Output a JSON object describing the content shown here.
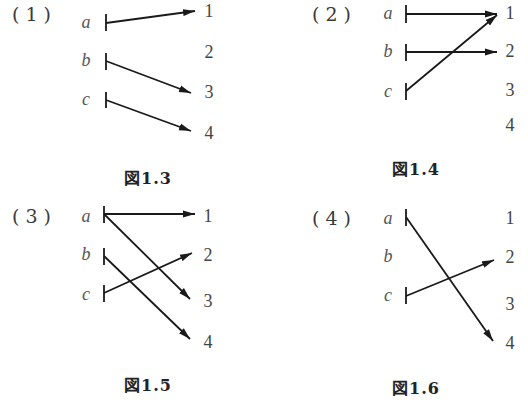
{
  "figures": [
    {
      "id": "panel-1",
      "number_label": "(1)",
      "caption": "図1.3",
      "sources": [
        "a",
        "b",
        "c"
      ],
      "targets": [
        "1",
        "2",
        "3",
        "4"
      ],
      "mappings": [
        {
          "from": "a",
          "to": "1"
        },
        {
          "from": "b",
          "to": "3"
        },
        {
          "from": "c",
          "to": "4"
        }
      ],
      "sources_with_tick": [
        "a",
        "b",
        "c"
      ]
    },
    {
      "id": "panel-2",
      "number_label": "(2)",
      "caption": "図1.4",
      "sources": [
        "a",
        "b",
        "c"
      ],
      "targets": [
        "1",
        "2",
        "3",
        "4"
      ],
      "mappings": [
        {
          "from": "a",
          "to": "1"
        },
        {
          "from": "b",
          "to": "2"
        },
        {
          "from": "c",
          "to": "1"
        }
      ],
      "sources_with_tick": [
        "a",
        "b",
        "c"
      ]
    },
    {
      "id": "panel-3",
      "number_label": "(3)",
      "caption": "図1.5",
      "sources": [
        "a",
        "b",
        "c"
      ],
      "targets": [
        "1",
        "2",
        "3",
        "4"
      ],
      "mappings": [
        {
          "from": "a",
          "to": "1"
        },
        {
          "from": "a",
          "to": "3"
        },
        {
          "from": "b",
          "to": "4"
        },
        {
          "from": "c",
          "to": "2"
        }
      ],
      "sources_with_tick": [
        "a",
        "b",
        "c"
      ]
    },
    {
      "id": "panel-4",
      "number_label": "(4)",
      "caption": "図1.6",
      "sources": [
        "a",
        "b",
        "c"
      ],
      "targets": [
        "1",
        "2",
        "3",
        "4"
      ],
      "mappings": [
        {
          "from": "a",
          "to": "4"
        },
        {
          "from": "c",
          "to": "2"
        }
      ],
      "sources_with_tick": [
        "a",
        "c"
      ]
    }
  ],
  "style": {
    "arrow_color": "#1a1a1a",
    "label_color": "#555555"
  }
}
